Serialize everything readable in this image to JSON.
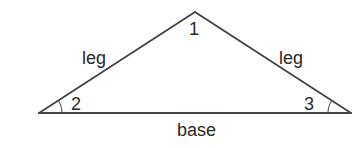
{
  "diagram": {
    "type": "isosceles-triangle",
    "vertices": {
      "apex": {
        "x": 195,
        "y": 12,
        "angle_label": "1"
      },
      "left": {
        "x": 39,
        "y": 113,
        "angle_label": "2"
      },
      "right": {
        "x": 351,
        "y": 113,
        "angle_label": "3"
      }
    },
    "sides": {
      "left_leg": {
        "label": "leg"
      },
      "right_leg": {
        "label": "leg"
      },
      "base": {
        "label": "base"
      }
    },
    "colors": {
      "line": "#444444",
      "text": "#2a2a2a",
      "background": "#ffffff"
    }
  }
}
